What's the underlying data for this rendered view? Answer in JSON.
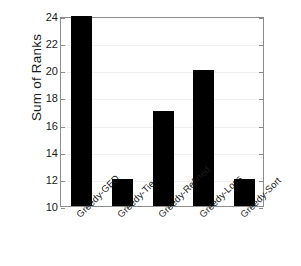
{
  "chart_data": {
    "type": "bar",
    "title": "",
    "xlabel": "",
    "ylabel": "Sum of Ranks",
    "categories": [
      "Greedy-GED",
      "Greedy-Tie",
      "Greedy-Refined",
      "Greedy-Loss",
      "Greedy-Sort"
    ],
    "values": [
      24,
      12,
      17,
      20,
      12
    ],
    "ylim": [
      10,
      24
    ],
    "yticks": [
      10,
      12,
      14,
      16,
      18,
      20,
      22,
      24
    ],
    "ytick_labels": [
      "10",
      "12",
      "14",
      "16",
      "18",
      "20",
      "22",
      "24"
    ],
    "grid": true,
    "legend": null,
    "bar_color": "#000000",
    "background_color": "#ffffff",
    "axis_color": "#8c8c8c",
    "grid_color": "#f0f0f0"
  }
}
